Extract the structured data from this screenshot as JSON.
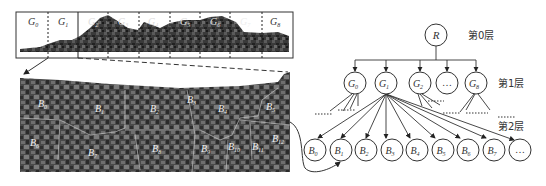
{
  "figure": {
    "strip": {
      "labels": [
        "G0",
        "G1",
        "G2",
        "G3",
        "G4",
        "G5",
        "G6",
        "G7",
        "G8"
      ]
    },
    "detail": {
      "block_labels": [
        "B0",
        "B1",
        "B2",
        "B3",
        "B4",
        "B5",
        "B6",
        "B7",
        "B8",
        "B9",
        "B10",
        "B11",
        "B12"
      ]
    },
    "tree": {
      "root": "R",
      "layer_labels": [
        "第0层",
        "第1层",
        "第2层"
      ],
      "layer1_nodes": [
        "G0",
        "G1",
        "G2",
        "…",
        "G8"
      ],
      "layer2_nodes": [
        "B0",
        "B1",
        "B2",
        "B3",
        "B4",
        "B5",
        "B6",
        "B7",
        "…"
      ],
      "ellipsis": "……"
    }
  }
}
